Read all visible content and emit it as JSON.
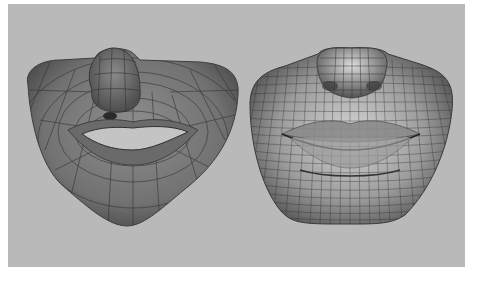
{
  "image": {
    "description": "Two 3D polygon mesh renders of a human mouth and nose region side by side",
    "background_color": "#b9b9b9",
    "frame_color": "#ffffff",
    "models": [
      {
        "id": "low-poly",
        "label": "Low-resolution base mesh with open mouth",
        "surface_color": "#7a7a7a",
        "wire_color": "#3a3a3a"
      },
      {
        "id": "subdivided",
        "label": "Subdivided high-density mesh with closed lips",
        "surface_color": "#a8a8a8",
        "wire_color": "#2e2e2e"
      }
    ]
  }
}
